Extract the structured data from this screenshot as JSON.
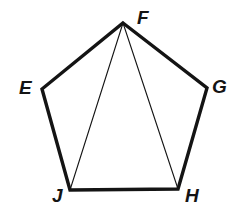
{
  "figure": {
    "kind": "geometry-diagram",
    "shape": "regular pentagon with two diagonals from apex",
    "background_color": "#ffffff",
    "stroke_color": "#141414",
    "outline_stroke_width": 3.4,
    "diagonal_stroke_width": 1.1,
    "canvas": {
      "width": 248,
      "height": 219
    },
    "vertices": [
      {
        "label": "F",
        "x": 123,
        "y": 23,
        "label_x": 137,
        "label_y": 8
      },
      {
        "label": "G",
        "x": 207,
        "y": 88,
        "label_x": 212,
        "label_y": 77
      },
      {
        "label": "H",
        "x": 178,
        "y": 189,
        "label_x": 185,
        "label_y": 186
      },
      {
        "label": "J",
        "x": 70,
        "y": 190,
        "label_x": 52,
        "label_y": 186
      },
      {
        "label": "E",
        "x": 42,
        "y": 89,
        "label_x": 19,
        "label_y": 78
      }
    ],
    "outline_path": "M 123 23 L 207 88 L 178 189 L 70 190 L 42 89 Z",
    "diagonals": [
      {
        "name": "F-J",
        "x1": 123,
        "y1": 23,
        "x2": 70,
        "y2": 190
      },
      {
        "name": "F-H",
        "x1": 123,
        "y1": 23,
        "x2": 178,
        "y2": 189
      }
    ],
    "labels": {
      "F": "F",
      "E": "E",
      "G": "G",
      "J": "J",
      "H": "H"
    }
  }
}
